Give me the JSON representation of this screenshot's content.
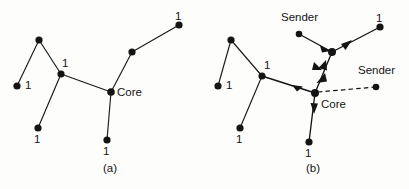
{
  "figure": {
    "type": "diagram",
    "background_color": "#fdfdfc",
    "ink_color": "#141414"
  },
  "panels": [
    {
      "id": "a",
      "caption": "(a)",
      "caption_pos": {
        "x": 103,
        "y": 163
      },
      "nodes": [
        {
          "name": "node-a-top",
          "x": 39,
          "y": 40
        },
        {
          "name": "node-a-left-leaf",
          "x": 17,
          "y": 86
        },
        {
          "name": "node-a-junction",
          "x": 61,
          "y": 74
        },
        {
          "name": "node-a-lower-leaf",
          "x": 38,
          "y": 128
        },
        {
          "name": "node-a-core",
          "x": 111,
          "y": 92
        },
        {
          "name": "node-a-bottom-leaf",
          "x": 107,
          "y": 140
        },
        {
          "name": "node-a-mid-right",
          "x": 132,
          "y": 52
        },
        {
          "name": "node-a-top-right",
          "x": 179,
          "y": 25
        }
      ],
      "edges": [
        {
          "from": "node-a-top",
          "to": "node-a-left-leaf"
        },
        {
          "from": "node-a-top",
          "to": "node-a-junction"
        },
        {
          "from": "node-a-junction",
          "to": "node-a-lower-leaf"
        },
        {
          "from": "node-a-junction",
          "to": "node-a-core"
        },
        {
          "from": "node-a-core",
          "to": "node-a-bottom-leaf"
        },
        {
          "from": "node-a-core",
          "to": "node-a-mid-right"
        },
        {
          "from": "node-a-mid-right",
          "to": "node-a-top-right"
        }
      ],
      "labels": [
        {
          "name": "weight-a-1",
          "text": "1",
          "x": 25,
          "y": 80
        },
        {
          "name": "weight-a-2",
          "text": "1",
          "x": 62,
          "y": 58
        },
        {
          "name": "weight-a-3",
          "text": "1",
          "x": 34,
          "y": 134
        },
        {
          "name": "weight-a-4",
          "text": "1",
          "x": 103,
          "y": 146
        },
        {
          "name": "weight-a-5",
          "text": "1",
          "x": 175,
          "y": 11
        },
        {
          "name": "core-a",
          "text": "Core",
          "x": 117,
          "y": 87
        }
      ]
    },
    {
      "id": "b",
      "caption": "(b)",
      "caption_pos": {
        "x": 306,
        "y": 163
      },
      "nodes": [
        {
          "name": "node-b-top",
          "x": 231,
          "y": 40
        },
        {
          "name": "node-b-left-leaf",
          "x": 218,
          "y": 86
        },
        {
          "name": "node-b-junction",
          "x": 262,
          "y": 76
        },
        {
          "name": "node-b-lower-leaf",
          "x": 240,
          "y": 128
        },
        {
          "name": "node-b-core",
          "x": 315,
          "y": 93
        },
        {
          "name": "node-b-bottom-leaf",
          "x": 309,
          "y": 142
        },
        {
          "name": "node-b-mid-right",
          "x": 332,
          "y": 52
        },
        {
          "name": "node-b-top-right",
          "x": 380,
          "y": 27
        },
        {
          "name": "node-b-sender-upper",
          "x": 299,
          "y": 34
        },
        {
          "name": "node-b-sender-right",
          "x": 376,
          "y": 87
        }
      ],
      "edges": [
        {
          "from": "node-b-top",
          "to": "node-b-left-leaf",
          "style": "solid"
        },
        {
          "from": "node-b-top",
          "to": "node-b-junction",
          "style": "solid"
        },
        {
          "from": "node-b-junction",
          "to": "node-b-lower-leaf",
          "style": "solid"
        },
        {
          "from": "node-b-junction",
          "to": "node-b-core",
          "style": "solid-arrow"
        },
        {
          "from": "node-b-core",
          "to": "node-b-bottom-leaf",
          "style": "solid-arrow"
        },
        {
          "from": "node-b-core",
          "to": "node-b-mid-right",
          "style": "solid-arrow"
        },
        {
          "from": "node-b-mid-right",
          "to": "node-b-top-right",
          "style": "solid-arrow"
        },
        {
          "from": "node-b-sender-upper",
          "to": "node-b-mid-right",
          "style": "solid-arrow"
        },
        {
          "from": "node-b-sender-right",
          "to": "node-b-core",
          "style": "dashed"
        }
      ],
      "labels": [
        {
          "name": "weight-b-1",
          "text": "1",
          "x": 226,
          "y": 80
        },
        {
          "name": "weight-b-2",
          "text": "1",
          "x": 264,
          "y": 60
        },
        {
          "name": "weight-b-3",
          "text": "1",
          "x": 236,
          "y": 134
        },
        {
          "name": "weight-b-4",
          "text": "1",
          "x": 305,
          "y": 148
        },
        {
          "name": "weight-b-5",
          "text": "1",
          "x": 376,
          "y": 13
        },
        {
          "name": "core-b",
          "text": "Core",
          "x": 321,
          "y": 99
        },
        {
          "name": "sender-upper",
          "text": "Sender",
          "x": 281,
          "y": 17
        },
        {
          "name": "sender-right",
          "text": "Sender",
          "x": 358,
          "y": 70
        }
      ]
    }
  ]
}
